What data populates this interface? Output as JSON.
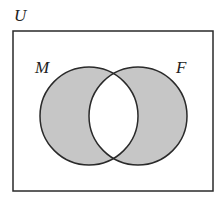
{
  "diagram": {
    "type": "venn",
    "universe_label": "U",
    "sets": [
      {
        "label": "M",
        "cx": 89,
        "cy": 116,
        "r": 49
      },
      {
        "label": "F",
        "cx": 138,
        "cy": 116,
        "r": 49
      }
    ],
    "shaded_region": "symmetric difference (M only and F only)",
    "colors": {
      "shade": "#c6c6c6",
      "stroke": "#2a2a2a",
      "background": "#ffffff"
    }
  }
}
